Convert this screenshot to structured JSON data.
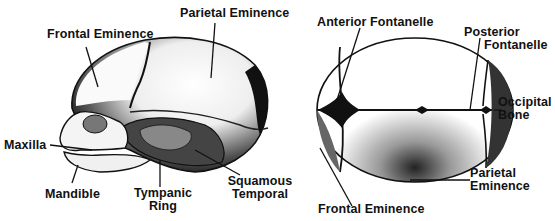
{
  "diagram": {
    "views": [
      {
        "name": "Lateral view",
        "labels": [
          {
            "id": "frontal-eminence",
            "text": "Frontal Eminence"
          },
          {
            "id": "parietal-eminence",
            "text": "Parietal Eminence"
          },
          {
            "id": "maxilla",
            "text": "Maxilla"
          },
          {
            "id": "mandible",
            "text": "Mandible"
          },
          {
            "id": "tympanic-ring",
            "lines": [
              "Tympanic",
              "Ring"
            ]
          },
          {
            "id": "squamous-temporal",
            "lines": [
              "Squamous",
              "Temporal"
            ]
          }
        ]
      },
      {
        "name": "Superior view",
        "labels": [
          {
            "id": "anterior-fontanelle",
            "text": "Anterior Fontanelle"
          },
          {
            "id": "posterior-fontanelle",
            "lines": [
              "Posterior",
              "Fontanelle"
            ]
          },
          {
            "id": "occipital-bone",
            "lines": [
              "Occipital",
              "Bone"
            ]
          },
          {
            "id": "parietal-eminence-top",
            "lines": [
              "Parietal",
              "Eminence"
            ]
          },
          {
            "id": "frontal-eminence-top",
            "text": "Frontal Eminence"
          }
        ]
      }
    ]
  }
}
